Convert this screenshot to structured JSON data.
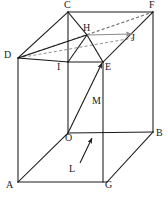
{
  "figure": {
    "type": "geometry-diagram",
    "width": 168,
    "height": 198,
    "background_color": "#ffffff",
    "stroke_color": "#1a1a1a",
    "gray_stroke_color": "#8c8c8c",
    "dashed_stroke_color": "#555555"
  },
  "points": [
    {
      "id": "C",
      "label": "C",
      "x": 68,
      "y": 12,
      "label_x": 64,
      "label_y": 0
    },
    {
      "id": "F",
      "label": "F",
      "x": 153,
      "y": 12,
      "label_x": 149,
      "label_y": 0
    },
    {
      "id": "H",
      "label": "H",
      "x": 87,
      "y": 35,
      "label_x": 83,
      "label_y": 23
    },
    {
      "id": "J",
      "label": "J",
      "x": 133,
      "y": 38,
      "label_x": 131,
      "label_y": 33
    },
    {
      "id": "D",
      "label": "D",
      "x": 18,
      "y": 58,
      "label_x": 4,
      "label_y": 50
    },
    {
      "id": "I",
      "label": "I",
      "x": 68,
      "y": 62,
      "label_x": 57,
      "label_y": 62
    },
    {
      "id": "E",
      "label": "E",
      "x": 103,
      "y": 62,
      "label_x": 105,
      "label_y": 62
    },
    {
      "id": "M",
      "label": "M",
      "x": 92,
      "y": 110,
      "label_x": 92,
      "label_y": 96
    },
    {
      "id": "O",
      "label": "O",
      "x": 68,
      "y": 133,
      "label_x": 65,
      "label_y": 133
    },
    {
      "id": "B",
      "label": "B",
      "x": 153,
      "y": 132,
      "label_x": 156,
      "label_y": 128
    },
    {
      "id": "L",
      "label": "L",
      "x": 80,
      "y": 163,
      "label_x": 69,
      "label_y": 164
    },
    {
      "id": "A",
      "label": "A",
      "x": 18,
      "y": 182,
      "label_x": 6,
      "label_y": 180
    },
    {
      "id": "G",
      "label": "G",
      "x": 107,
      "y": 182,
      "label_x": 105,
      "label_y": 180
    }
  ],
  "edges_solid": [
    {
      "name": "edge-D-C",
      "from": "D",
      "to": "C"
    },
    {
      "name": "edge-C-F",
      "from": "C",
      "to": "F"
    },
    {
      "name": "edge-C-I",
      "from": "C",
      "to": "I"
    },
    {
      "name": "edge-D-I",
      "from": "D",
      "to": "I"
    },
    {
      "name": "edge-I-E",
      "from": "I",
      "to": "E"
    },
    {
      "name": "edge-E-F",
      "from": "E",
      "to": "F"
    },
    {
      "name": "edge-D-A",
      "from": "D",
      "to": "A"
    },
    {
      "name": "edge-I-O",
      "from": "I",
      "to": "O"
    },
    {
      "name": "edge-E-B",
      "from": "E",
      "to": "B"
    },
    {
      "name": "edge-F-B",
      "from": "F",
      "to": "B"
    },
    {
      "name": "edge-A-G",
      "from": "A",
      "to": "G"
    },
    {
      "name": "edge-A-O",
      "from": "A",
      "to": "O"
    },
    {
      "name": "edge-O-B",
      "from": "O",
      "to": "B"
    },
    {
      "name": "edge-O-G",
      "from": "O",
      "to": "G"
    },
    {
      "name": "edge-G-B",
      "from": "G",
      "to": "B"
    },
    {
      "name": "edge-C-H",
      "from": "C",
      "to": "H"
    },
    {
      "name": "edge-H-E",
      "from": "H",
      "to": "E"
    },
    {
      "name": "edge-H-I",
      "from": "H",
      "to": "I"
    }
  ],
  "edges_dashed": [
    {
      "name": "diag-D-F",
      "from": "D",
      "to": "F"
    },
    {
      "name": "diag-D-H-J",
      "from": "D",
      "to": "J"
    },
    {
      "name": "diag-H-F",
      "from": "H",
      "to": "F"
    }
  ],
  "vectors": [
    {
      "name": "vector-O-E",
      "from": "O",
      "to": "E",
      "color": "#1a1a1a",
      "style": "solid-arrow"
    },
    {
      "name": "vector-L-M",
      "from": "L",
      "to": "M",
      "color": "#1a1a1a",
      "style": "solid-arrow"
    },
    {
      "name": "vector-H-J",
      "from": "H",
      "to": "J",
      "color": "#8c8c8c",
      "style": "solid-arrow-gray"
    }
  ]
}
